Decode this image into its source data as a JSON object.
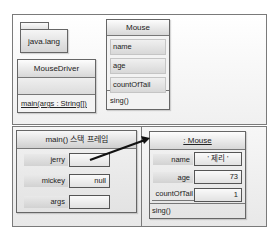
{
  "package": {
    "name": "java.lang"
  },
  "mouse_driver": {
    "name": "MouseDriver",
    "method": "main(args : String[])"
  },
  "mouse_class": {
    "name": "Mouse",
    "fields": [
      "name",
      "age",
      "countOfTail"
    ],
    "method": "sing()"
  },
  "stack_frame": {
    "title": "main() 스택 프레임",
    "vars": [
      {
        "name": "jerry",
        "value": ""
      },
      {
        "name": "mickey",
        "value": "null"
      },
      {
        "name": "args",
        "value": ""
      }
    ]
  },
  "instance": {
    "title": ": Mouse",
    "fields": [
      {
        "name": "name",
        "value": "' 제리 '"
      },
      {
        "name": "age",
        "value": "73"
      },
      {
        "name": "countOfTail",
        "value": "1"
      }
    ],
    "method": "sing()"
  }
}
